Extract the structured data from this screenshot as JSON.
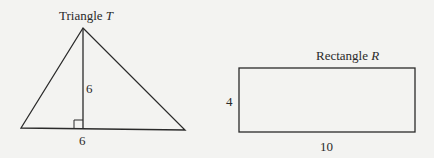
{
  "triangle": {
    "title_prefix": "Triangle",
    "title_var": "T",
    "height_label": "6",
    "base_label": "6",
    "right_angle_marker": true
  },
  "rectangle": {
    "title_prefix": "Rectangle",
    "title_var": "R",
    "height_label": "4",
    "width_label": "10"
  },
  "colors": {
    "background": "#f3f3f1",
    "stroke": "#2a2a2a"
  }
}
